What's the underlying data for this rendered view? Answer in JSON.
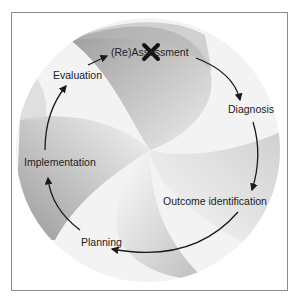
{
  "diagram": {
    "type": "cycle",
    "stages": [
      {
        "label": "(Re)Assessment",
        "marked_with_x": true
      },
      {
        "label": "Diagnosis"
      },
      {
        "label": "Outcome identification"
      },
      {
        "label": "Planning"
      },
      {
        "label": "Implementation"
      },
      {
        "label": "Evaluation"
      }
    ],
    "flow": "clockwise",
    "marker_icon": "x-mark",
    "colors": {
      "arrow": "#1a1a1a",
      "petal_dark": "#a8a8a8",
      "petal_light": "#f2f2f2",
      "border": "#8a8a8a"
    }
  }
}
